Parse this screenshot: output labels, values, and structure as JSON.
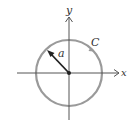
{
  "diagram": {
    "type": "circle-on-axes",
    "labels": {
      "x_axis": "x",
      "y_axis": "y",
      "radius": "a",
      "curve": "C"
    },
    "colors": {
      "axes": "#555555",
      "circle": "#9a9a9a",
      "radius_arrow": "#222222",
      "text": "#333333"
    },
    "geometry": {
      "origin": [
        69,
        73
      ],
      "radius": 33,
      "radius_angle_deg": 135,
      "orientation_arrow": "counterclockwise on C near upper-right"
    }
  }
}
